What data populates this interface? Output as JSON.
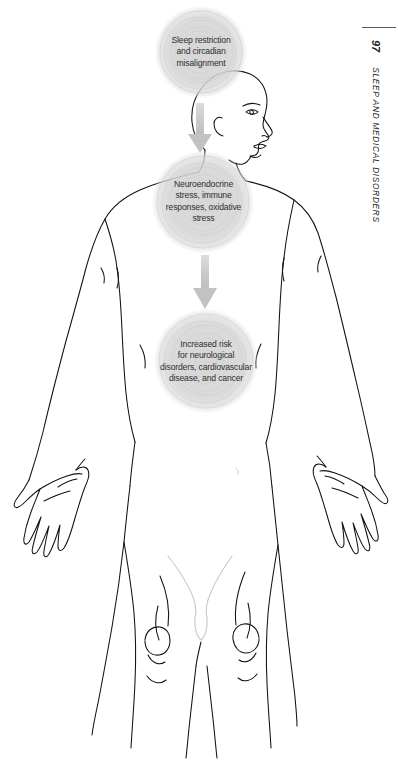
{
  "page": {
    "background_color": "#ffffff",
    "running_head": {
      "title": "SLEEP AND MEDICAL DISORDERS",
      "page_number": "97",
      "rule_color": "#5a5a5a"
    }
  },
  "figure": {
    "type": "flow-diagram-over-anatomical-illustration",
    "illustration_name": "human-body-outline-front-view",
    "line_color": "#111111",
    "node_fill_color": "#d6d6d6",
    "arrow_color": "#c2c2c2",
    "text_color": "#2e2e2e",
    "nodes": [
      {
        "id": "node-1",
        "label": "Sleep restriction\nand circadian\nmisalignment",
        "shape": "circle",
        "fill": "#d8d8d8"
      },
      {
        "id": "node-2",
        "label": "Neuroendocrine\nstress, immune\nresponses, oxidative\nstress",
        "shape": "circle",
        "fill": "#d6d6d6"
      },
      {
        "id": "node-3",
        "label": "Increased risk\nfor neurological\ndisorders, cardiovascular\ndisease, and cancer",
        "shape": "circle",
        "fill": "#d6d6d6"
      }
    ],
    "arrows": [
      {
        "id": "arrow-1",
        "from": "node-1",
        "to": "node-2",
        "direction": "down"
      },
      {
        "id": "arrow-2",
        "from": "node-2",
        "to": "node-3",
        "direction": "down"
      }
    ]
  }
}
